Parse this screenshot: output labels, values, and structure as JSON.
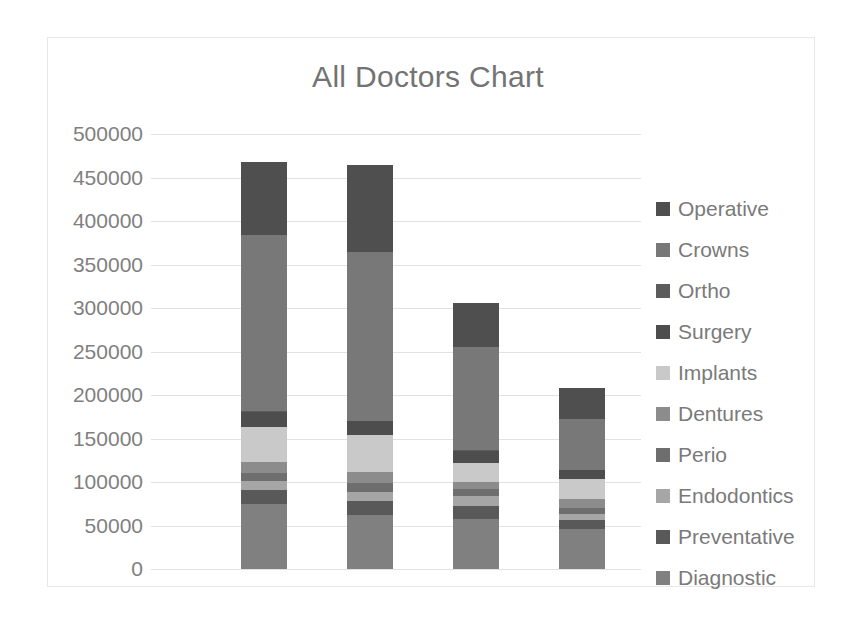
{
  "chart_data": {
    "type": "bar",
    "subtype": "stacked-column",
    "title": "All Doctors Chart",
    "xlabel": "",
    "ylabel": "",
    "ylim": [
      0,
      500000
    ],
    "ytick_step": 50000,
    "yticks": [
      "500000",
      "450000",
      "400000",
      "350000",
      "300000",
      "250000",
      "200000",
      "150000",
      "100000",
      "50000",
      "0"
    ],
    "grid": true,
    "legend_position": "right",
    "categories": [
      "Doctor 1",
      "Doctor 2",
      "Doctor 3",
      "Doctor 4"
    ],
    "category_labels_visible": false,
    "series": [
      {
        "name": "Diagnostic",
        "color": "#808080",
        "values": [
          75000,
          62000,
          58000,
          46000
        ]
      },
      {
        "name": "Preventative",
        "color": "#595959",
        "values": [
          16000,
          16000,
          14000,
          10000
        ]
      },
      {
        "name": "Endodontics",
        "color": "#a6a6a6",
        "values": [
          10000,
          11000,
          12000,
          7000
        ]
      },
      {
        "name": "Perio",
        "color": "#6e6e6e",
        "values": [
          9000,
          10000,
          8000,
          7000
        ]
      },
      {
        "name": "Dentures",
        "color": "#8c8c8c",
        "values": [
          13000,
          13000,
          8000,
          10000
        ]
      },
      {
        "name": "Implants",
        "color": "#c9c9c9",
        "values": [
          40000,
          42000,
          22000,
          23000
        ]
      },
      {
        "name": "Surgery",
        "color": "#4d4d4d",
        "values": [
          18000,
          16000,
          14000,
          11000
        ]
      },
      {
        "name": "Ortho",
        "color": "#5c5c5c",
        "values": [
          500,
          500,
          400,
          300
        ]
      },
      {
        "name": "Crowns",
        "color": "#787878",
        "values": [
          202500,
          193500,
          118600,
          58700
        ]
      },
      {
        "name": "Operative",
        "color": "#4f4f4f",
        "values": [
          84000,
          100000,
          51000,
          35000
        ]
      }
    ],
    "totals": [
      468000,
      464000,
      306000,
      208000
    ]
  },
  "legend": {
    "items": [
      {
        "label": "Operative",
        "color": "#4f4f4f"
      },
      {
        "label": "Crowns",
        "color": "#787878"
      },
      {
        "label": "Ortho",
        "color": "#5c5c5c"
      },
      {
        "label": "Surgery",
        "color": "#4d4d4d"
      },
      {
        "label": "Implants",
        "color": "#c9c9c9"
      },
      {
        "label": "Dentures",
        "color": "#8c8c8c"
      },
      {
        "label": "Perio",
        "color": "#6e6e6e"
      },
      {
        "label": "Endodontics",
        "color": "#a6a6a6"
      },
      {
        "label": "Preventative",
        "color": "#595959"
      },
      {
        "label": "Diagnostic",
        "color": "#808080"
      }
    ]
  }
}
